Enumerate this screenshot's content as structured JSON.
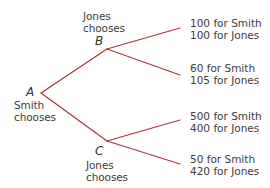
{
  "diagram": {
    "type": "game-tree",
    "line_color": "#a83838",
    "text_color": "#3c3c3c",
    "nodes": [
      {
        "id": "A",
        "letter": "A",
        "chooser_line1": "Smith",
        "chooser_line2": "chooses",
        "x": 41,
        "y": 93
      },
      {
        "id": "B",
        "letter": "B",
        "chooser_line1": "Jones",
        "chooser_line2": "chooses",
        "x": 107,
        "y": 49
      },
      {
        "id": "C",
        "letter": "C",
        "chooser_line1": "Jones",
        "chooser_line2": "chooses",
        "x": 107,
        "y": 141
      }
    ],
    "edges": [
      {
        "from": "A",
        "to": "B"
      },
      {
        "from": "A",
        "to": "C"
      },
      {
        "from": "B",
        "to": "outcome_1"
      },
      {
        "from": "B",
        "to": "outcome_2"
      },
      {
        "from": "C",
        "to": "outcome_3"
      },
      {
        "from": "C",
        "to": "outcome_4"
      }
    ],
    "outcomes": [
      {
        "id": "outcome_1",
        "smith": "100 for Smith",
        "jones": "100 for Jones"
      },
      {
        "id": "outcome_2",
        "smith": "60 for Smith",
        "jones": "105 for Jones"
      },
      {
        "id": "outcome_3",
        "smith": "500 for Smith",
        "jones": "400 for Jones"
      },
      {
        "id": "outcome_4",
        "smith": "50 for Smith",
        "jones": "420 for Jones"
      }
    ]
  }
}
